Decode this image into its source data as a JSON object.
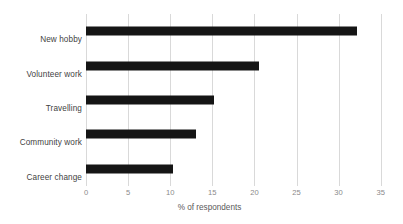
{
  "chart_data": {
    "type": "bar",
    "orientation": "horizontal",
    "title": "",
    "subtitle": "",
    "categories": [
      "New hobby",
      "Volunteer work",
      "Travelling",
      "Community work",
      "Career change"
    ],
    "values": [
      32.1,
      20.5,
      15.2,
      13.0,
      10.3
    ],
    "series": [
      {
        "name": "% of respondents",
        "values": [
          32.1,
          20.5,
          15.2,
          13.0,
          10.3
        ]
      }
    ],
    "xlabel": "% of respondents",
    "ylabel": "",
    "xlim": [
      0,
      35
    ],
    "xticks": [
      0,
      5,
      10,
      15,
      20,
      25,
      30,
      35
    ],
    "xtick_labels": [
      "0",
      "5",
      "10",
      "15",
      "20",
      "25",
      "30",
      "35"
    ],
    "grid": "vertical",
    "legend": "none",
    "bar_color": "#151515",
    "gridline_color": "#d9d9d9",
    "tick_label_color": "#8a8a8a",
    "category_label_color": "#3f3f3f",
    "background_color": "#ffffff"
  }
}
